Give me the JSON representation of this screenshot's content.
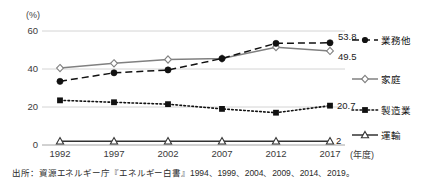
{
  "chart_data": {
    "type": "line",
    "title": "",
    "xlabel": "(年度)",
    "ylabel": "(%)",
    "ylim": [
      0,
      60
    ],
    "yticks": [
      0,
      20,
      40,
      60
    ],
    "ytick_labels": [
      "0",
      "20",
      "40",
      "60"
    ],
    "categories": [
      "1992",
      "1997",
      "2002",
      "2007",
      "2012",
      "2017"
    ],
    "grid": true,
    "legend_position": "right",
    "series": [
      {
        "name": "業務他",
        "values": [
          33.5,
          38.0,
          39.5,
          45.5,
          53.5,
          53.8
        ],
        "end_label": "53.8",
        "marker": "filled-circle",
        "line_style": "dashed",
        "color": "#111111"
      },
      {
        "name": "家庭",
        "values": [
          40.5,
          43.0,
          45.0,
          45.5,
          51.5,
          49.5
        ],
        "end_label": "49.5",
        "marker": "open-diamond",
        "line_style": "solid",
        "color": "#808080"
      },
      {
        "name": "製造業",
        "values": [
          23.5,
          22.5,
          21.5,
          19.0,
          17.0,
          20.7
        ],
        "end_label": "20.7",
        "marker": "filled-square",
        "line_style": "dotted",
        "color": "#111111"
      },
      {
        "name": "運輸",
        "values": [
          2.0,
          2.0,
          2.0,
          2.0,
          2.0,
          2.0
        ],
        "end_label": "2",
        "marker": "open-triangle",
        "line_style": "solid",
        "color": "#333333"
      }
    ]
  },
  "axis": {
    "unit_label": "(%)",
    "x_unit_label": "(年度)"
  },
  "source": {
    "text": "出所：資源エネルギー庁『エネルギー白書』1994、1999、2004、2009、2014、2019。"
  },
  "legend": {
    "items": [
      {
        "label": "業務他"
      },
      {
        "label": "家庭"
      },
      {
        "label": "製造業"
      },
      {
        "label": "運輸"
      }
    ]
  }
}
